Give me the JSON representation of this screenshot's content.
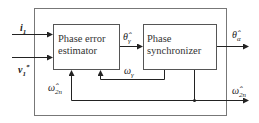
{
  "diagram": {
    "blocks": [
      {
        "id": "phase-error-estimator",
        "line1": "Phase error",
        "line2": "estimator"
      },
      {
        "id": "phase-synchronizer",
        "line1": "Phase",
        "line2": "synchronizer"
      }
    ],
    "inputs": {
      "i1": {
        "symbol": "i",
        "sub": "1"
      },
      "v1": {
        "symbol": "v",
        "sub": "1",
        "sup": "*"
      }
    },
    "signals": {
      "theta_gamma": {
        "symbol": "θ̂",
        "sub": "γ"
      },
      "omega_gamma": {
        "symbol": "ω",
        "sub": "γ"
      },
      "omega_2n_left": {
        "symbol": "ω̂",
        "sub": "2n"
      },
      "theta_alpha": {
        "symbol": "θ̂",
        "sub": "α"
      },
      "omega_2n_out": {
        "symbol": "ω̂",
        "sub": "2n"
      }
    },
    "colors": {
      "line": "#333333",
      "box_border": "#555555",
      "frame": "#666666"
    }
  }
}
